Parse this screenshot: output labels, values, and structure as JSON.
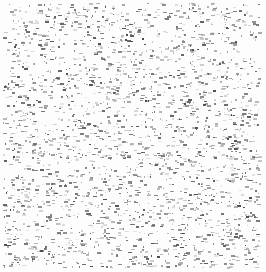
{
  "image": {
    "kind": "speckle-noise-texture",
    "width": 266,
    "height": 272,
    "background": "#fdfdfd",
    "speck_colors": [
      "#4a4a4a",
      "#5e5e5e",
      "#707070",
      "#858585",
      "#9a9a9a",
      "#b0b0b0",
      "#c4c4c4",
      "#d6d6d6"
    ],
    "speck_count": 2600,
    "margin": 3,
    "seed": 1337,
    "speck_width_range": [
      1,
      4
    ],
    "speck_height_range": [
      1,
      2
    ]
  }
}
